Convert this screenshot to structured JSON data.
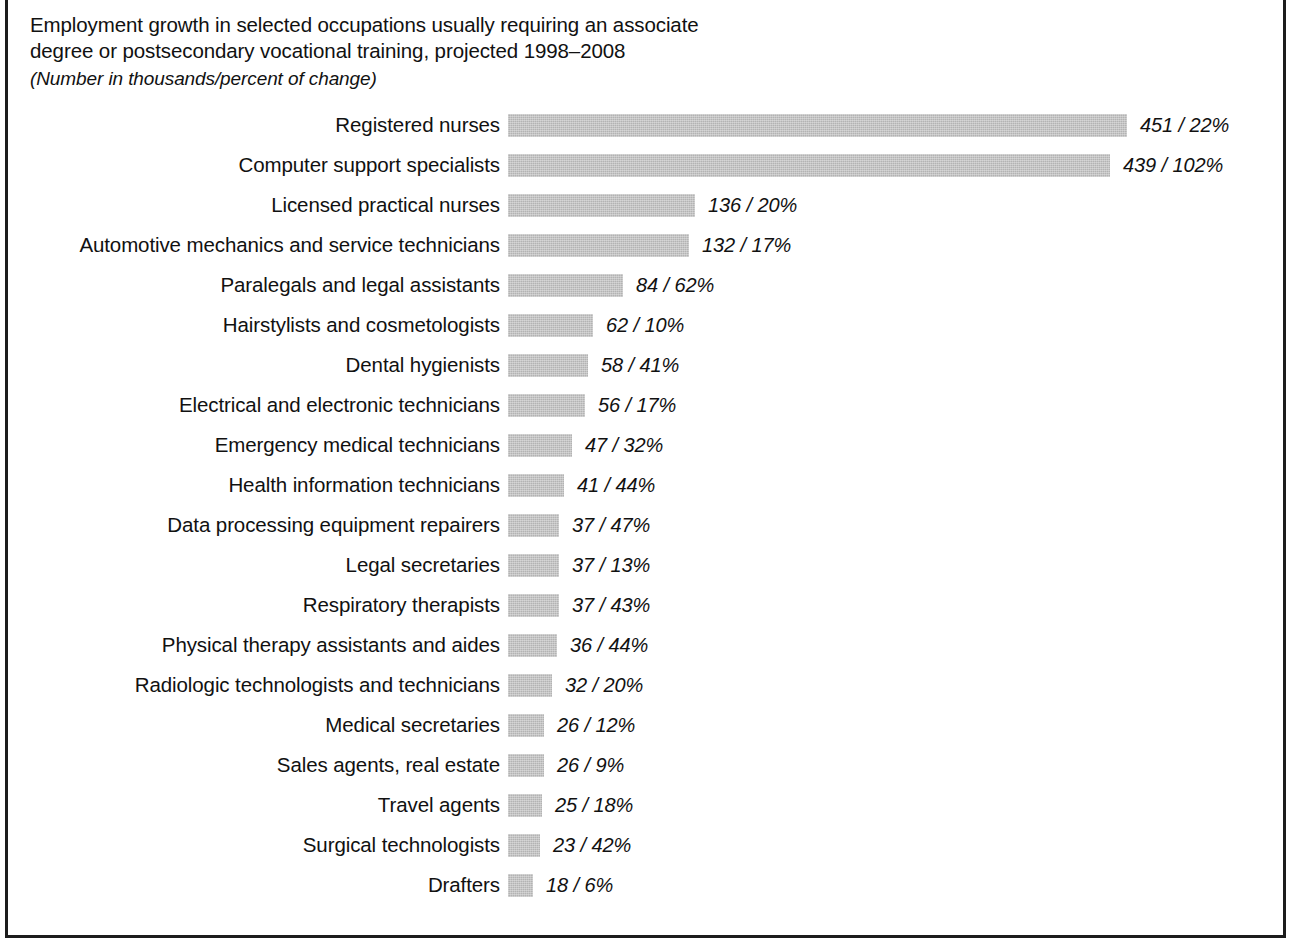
{
  "title": {
    "line1": "Employment growth in selected occupations usually requiring an associate",
    "line2": "degree or postsecondary vocational training, projected 1998–2008",
    "subtitle": "(Number in thousands/percent of change)"
  },
  "colors": {
    "bar_fill": "#b3b3b3",
    "frame": "#1c1c1c",
    "text": "#111111",
    "background": "#ffffff"
  },
  "chart_data": {
    "type": "bar",
    "orientation": "horizontal",
    "title": "Employment growth in selected occupations usually requiring an associate degree or postsecondary vocational training, projected 1998–2008",
    "subtitle": "(Number in thousands/percent of change)",
    "xlabel": "",
    "ylabel": "",
    "value_units": "thousands",
    "xlim": [
      0,
      451
    ],
    "grid": false,
    "legend": null,
    "categories": [
      "Registered nurses",
      "Computer support specialists",
      "Licensed practical nurses",
      "Automotive mechanics and service technicians",
      "Paralegals and legal assistants",
      "Hairstylists and cosmetologists",
      "Dental hygienists",
      "Electrical and electronic technicians",
      "Emergency medical technicians",
      "Health information technicians",
      "Data processing equipment repairers",
      "Legal secretaries",
      "Respiratory therapists",
      "Physical therapy assistants and aides",
      "Radiologic technologists and technicians",
      "Medical secretaries",
      "Sales agents, real estate",
      "Travel agents",
      "Surgical technologists",
      "Drafters"
    ],
    "values": [
      451,
      439,
      136,
      132,
      84,
      62,
      58,
      56,
      47,
      41,
      37,
      37,
      37,
      36,
      32,
      26,
      26,
      25,
      23,
      18
    ],
    "percent_change": [
      22,
      102,
      20,
      17,
      62,
      10,
      41,
      17,
      32,
      44,
      47,
      13,
      43,
      44,
      20,
      12,
      9,
      18,
      42,
      6
    ],
    "data_labels": [
      "451 / 22%",
      "439 / 102%",
      "136 / 20%",
      "132 / 17%",
      "84 / 62%",
      "62 / 10%",
      "58 / 41%",
      "56 / 17%",
      "47 / 32%",
      "41 / 44%",
      "37 / 47%",
      "37 / 13%",
      "37 / 43%",
      "36 / 44%",
      "32 / 20%",
      "26 / 12%",
      "26 / 9%",
      "25 / 18%",
      "23 / 42%",
      "18 / 6%"
    ]
  },
  "layout": {
    "bar_origin_x": 508,
    "px_per_unit": 1.372,
    "min_bar_px": 25,
    "row_pitch": 40
  }
}
